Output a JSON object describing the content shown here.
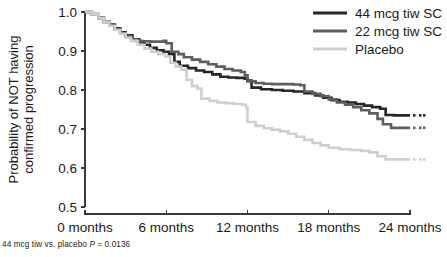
{
  "chart_data": {
    "type": "line",
    "subtype": "kaplan-meier-survival",
    "title": "",
    "xlabel": "",
    "ylabel": "Probability of NOT having confirmed progression",
    "ylabel_lines": [
      "Probability of NOT having",
      "confirmed progression"
    ],
    "xlim": [
      0,
      24
    ],
    "ylim": [
      0.5,
      1.0
    ],
    "x_unit": "months",
    "xticks": [
      0,
      6,
      12,
      18,
      24
    ],
    "xtick_labels": [
      "0 months",
      "6 months",
      "12 months",
      "18 months",
      "24 months"
    ],
    "yticks": [
      0.5,
      0.6,
      0.7,
      0.8,
      0.9,
      1.0
    ],
    "ytick_labels": [
      "0.5",
      "0.6",
      "0.7",
      "0.8",
      "0.9",
      "1.0"
    ],
    "grid": false,
    "legend_position": "top-right",
    "series": [
      {
        "name": "44 mcg tiw SC",
        "color": "#262626",
        "steps": [
          [
            0.0,
            1.0
          ],
          [
            0.5,
            0.995
          ],
          [
            1.0,
            0.985
          ],
          [
            1.4,
            0.975
          ],
          [
            1.8,
            0.968
          ],
          [
            2.2,
            0.958
          ],
          [
            2.6,
            0.948
          ],
          [
            3.0,
            0.94
          ],
          [
            3.5,
            0.93
          ],
          [
            4.0,
            0.922
          ],
          [
            4.4,
            0.916
          ],
          [
            4.8,
            0.908
          ],
          [
            5.3,
            0.902
          ],
          [
            5.8,
            0.898
          ],
          [
            6.2,
            0.892
          ],
          [
            6.6,
            0.872
          ],
          [
            7.0,
            0.862
          ],
          [
            7.6,
            0.856
          ],
          [
            8.2,
            0.85
          ],
          [
            8.8,
            0.846
          ],
          [
            9.4,
            0.84
          ],
          [
            10.0,
            0.834
          ],
          [
            10.6,
            0.832
          ],
          [
            11.2,
            0.831
          ],
          [
            11.8,
            0.829
          ],
          [
            12.0,
            0.824
          ],
          [
            12.3,
            0.806
          ],
          [
            13.0,
            0.802
          ],
          [
            13.8,
            0.8
          ],
          [
            14.6,
            0.798
          ],
          [
            15.4,
            0.796
          ],
          [
            16.2,
            0.792
          ],
          [
            17.0,
            0.786
          ],
          [
            17.6,
            0.78
          ],
          [
            18.2,
            0.774
          ],
          [
            18.8,
            0.77
          ],
          [
            19.4,
            0.768
          ],
          [
            20.0,
            0.764
          ],
          [
            20.6,
            0.76
          ],
          [
            21.2,
            0.756
          ],
          [
            21.8,
            0.752
          ],
          [
            22.2,
            0.736
          ],
          [
            22.8,
            0.735
          ],
          [
            24.0,
            0.735
          ]
        ],
        "final_value": 0.735
      },
      {
        "name": "22 mcg tiw SC",
        "color": "#5e5e5e",
        "steps": [
          [
            0.0,
            1.0
          ],
          [
            0.5,
            0.994
          ],
          [
            1.0,
            0.984
          ],
          [
            1.4,
            0.974
          ],
          [
            1.8,
            0.966
          ],
          [
            2.2,
            0.956
          ],
          [
            2.6,
            0.946
          ],
          [
            3.0,
            0.938
          ],
          [
            3.4,
            0.93
          ],
          [
            3.8,
            0.926
          ],
          [
            4.2,
            0.925
          ],
          [
            4.8,
            0.924
          ],
          [
            5.4,
            0.924
          ],
          [
            5.8,
            0.926
          ],
          [
            6.0,
            0.92
          ],
          [
            6.4,
            0.898
          ],
          [
            6.9,
            0.892
          ],
          [
            7.3,
            0.884
          ],
          [
            7.9,
            0.878
          ],
          [
            8.5,
            0.872
          ],
          [
            9.1,
            0.866
          ],
          [
            9.7,
            0.86
          ],
          [
            10.3,
            0.854
          ],
          [
            10.9,
            0.85
          ],
          [
            11.5,
            0.846
          ],
          [
            11.8,
            0.838
          ],
          [
            12.0,
            0.822
          ],
          [
            12.6,
            0.818
          ],
          [
            13.2,
            0.816
          ],
          [
            13.8,
            0.815
          ],
          [
            14.6,
            0.815
          ],
          [
            15.4,
            0.814
          ],
          [
            15.9,
            0.812
          ],
          [
            16.2,
            0.796
          ],
          [
            16.8,
            0.79
          ],
          [
            17.4,
            0.784
          ],
          [
            18.0,
            0.776
          ],
          [
            18.6,
            0.768
          ],
          [
            19.2,
            0.762
          ],
          [
            19.8,
            0.756
          ],
          [
            20.4,
            0.748
          ],
          [
            21.0,
            0.74
          ],
          [
            21.6,
            0.726
          ],
          [
            22.0,
            0.712
          ],
          [
            22.6,
            0.703
          ],
          [
            24.0,
            0.703
          ]
        ],
        "final_value": 0.703
      },
      {
        "name": "Placebo",
        "color": "#cfcfcf",
        "steps": [
          [
            0.0,
            1.0
          ],
          [
            0.5,
            0.994
          ],
          [
            1.0,
            0.984
          ],
          [
            1.4,
            0.974
          ],
          [
            1.8,
            0.964
          ],
          [
            2.2,
            0.954
          ],
          [
            2.6,
            0.944
          ],
          [
            3.0,
            0.934
          ],
          [
            3.4,
            0.926
          ],
          [
            3.9,
            0.916
          ],
          [
            4.4,
            0.906
          ],
          [
            4.9,
            0.898
          ],
          [
            5.4,
            0.892
          ],
          [
            5.9,
            0.886
          ],
          [
            6.3,
            0.87
          ],
          [
            6.7,
            0.86
          ],
          [
            7.1,
            0.852
          ],
          [
            7.5,
            0.826
          ],
          [
            7.9,
            0.81
          ],
          [
            8.3,
            0.804
          ],
          [
            8.6,
            0.778
          ],
          [
            9.2,
            0.772
          ],
          [
            9.8,
            0.768
          ],
          [
            10.4,
            0.766
          ],
          [
            11.0,
            0.764
          ],
          [
            11.6,
            0.762
          ],
          [
            11.9,
            0.756
          ],
          [
            12.0,
            0.718
          ],
          [
            12.6,
            0.708
          ],
          [
            13.2,
            0.702
          ],
          [
            13.8,
            0.698
          ],
          [
            14.4,
            0.694
          ],
          [
            15.0,
            0.688
          ],
          [
            15.6,
            0.68
          ],
          [
            16.2,
            0.672
          ],
          [
            16.8,
            0.664
          ],
          [
            17.4,
            0.658
          ],
          [
            18.0,
            0.652
          ],
          [
            18.8,
            0.648
          ],
          [
            19.6,
            0.646
          ],
          [
            20.4,
            0.644
          ],
          [
            21.0,
            0.64
          ],
          [
            21.6,
            0.63
          ],
          [
            22.2,
            0.622
          ],
          [
            24.0,
            0.622
          ]
        ],
        "final_value": 0.622
      }
    ],
    "annotations": [
      {
        "name": "p-value-footnote",
        "prefix": "44 mcg tiw vs. placebo ",
        "italic": "P",
        "suffix": " = 0.0136",
        "full_text": "44 mcg tiw vs. placebo P = 0.0136"
      }
    ]
  },
  "legend": {
    "entries": [
      {
        "label": "44 mcg tiw SC",
        "color": "#262626"
      },
      {
        "label": "22 mcg tiw SC",
        "color": "#5e5e5e"
      },
      {
        "label": "Placebo",
        "color": "#cfcfcf"
      }
    ]
  },
  "colors": {
    "axis": "#3a3a3a",
    "text": "#1a1a1a",
    "background": "#ffffff",
    "series_44mcg": "#262626",
    "series_22mcg": "#5e5e5e",
    "series_placebo": "#cfcfcf"
  }
}
